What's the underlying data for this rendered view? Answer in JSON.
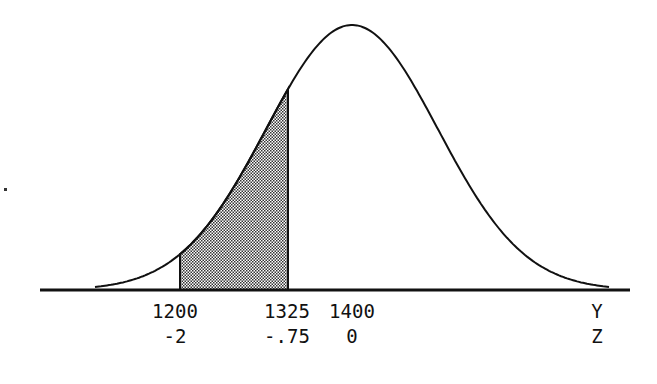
{
  "figure": {
    "type": "normal-distribution-shaded-area",
    "mean_y": 1400,
    "sd_y": 100,
    "shaded_region": {
      "from_y": 1200,
      "to_y": 1325,
      "from_z": -2,
      "to_z": -0.75
    },
    "colors": {
      "line": "#111111",
      "shade_dark": "#333333",
      "shade_light": "#ffffff",
      "background": "#ffffff"
    }
  },
  "axis": {
    "y_labels": [
      {
        "text": "1200",
        "x": 175
      },
      {
        "text": "1325",
        "x": 287
      },
      {
        "text": "1400",
        "x": 352
      }
    ],
    "z_labels": [
      {
        "text": "-2",
        "x": 175
      },
      {
        "text": "-.75",
        "x": 287
      },
      {
        "text": "0",
        "x": 352
      }
    ],
    "y_axis_name": "Y",
    "z_axis_name": "Z"
  }
}
